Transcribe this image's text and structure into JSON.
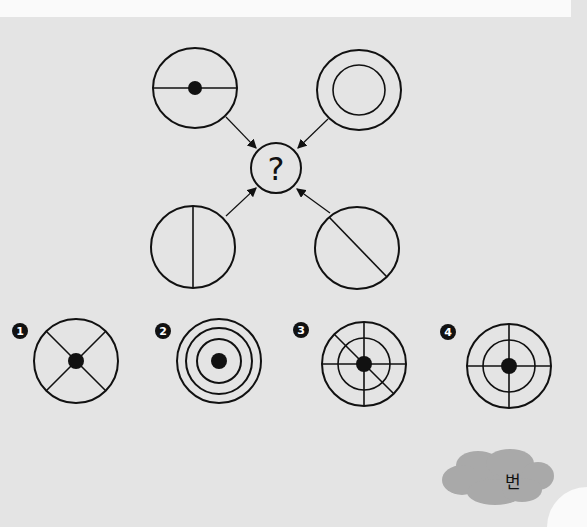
{
  "puzzle": {
    "center_symbol": "?",
    "inputs": [
      {
        "id": "top-left",
        "description": "circle with horizontal diameter and center dot"
      },
      {
        "id": "top-right",
        "description": "two concentric circles"
      },
      {
        "id": "bottom-left",
        "description": "circle with vertical diameter"
      },
      {
        "id": "bottom-right",
        "description": "circle with diagonal line"
      }
    ]
  },
  "options": [
    {
      "number": "1",
      "description": "circle with X lines and center dot"
    },
    {
      "number": "2",
      "description": "three concentric circles with center dot"
    },
    {
      "number": "3",
      "description": "two concentric circles with horizontal, vertical, diagonal lines and center dot"
    },
    {
      "number": "4",
      "description": "two concentric circles with horizontal and vertical lines and center dot"
    }
  ],
  "answer": {
    "label": "번"
  }
}
